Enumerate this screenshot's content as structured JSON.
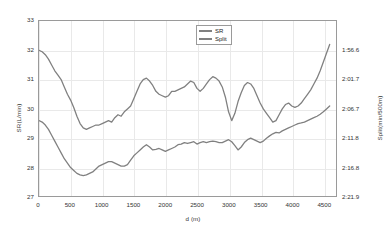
{
  "chart_data": {
    "type": "line",
    "title": "",
    "xlabel": "d (m)",
    "ylabel": "SR(L/min)",
    "ylabel_right": "Split(min/500m)",
    "xlim": [
      0,
      4700
    ],
    "ylim": [
      27,
      33
    ],
    "grid": true,
    "legend_position": "top-center",
    "xticks": [
      0,
      500,
      1000,
      1500,
      2000,
      2500,
      3000,
      3500,
      4000,
      4500
    ],
    "xticklabels": [
      "0",
      "500",
      "1000",
      "1500",
      "2000",
      "2500",
      "3000",
      "3500",
      "4000",
      "4500"
    ],
    "yticks": [
      27,
      28,
      29,
      30,
      31,
      32,
      33
    ],
    "yticklabels": [
      "27",
      "28",
      "29",
      "30",
      "31",
      "32",
      "33"
    ],
    "yticks_right": [
      27,
      28,
      29,
      30,
      31,
      32
    ],
    "yticklabels_right": [
      "2:21.9",
      "2:16.8",
      "2:11.8",
      "2:06.7",
      "2:01.7",
      "1:56.6"
    ],
    "line_color": "#808080",
    "series": [
      {
        "name": "SR",
        "x": [
          0,
          50,
          100,
          150,
          200,
          250,
          300,
          350,
          400,
          450,
          500,
          550,
          600,
          650,
          700,
          750,
          800,
          850,
          900,
          950,
          1000,
          1050,
          1100,
          1150,
          1200,
          1250,
          1300,
          1350,
          1400,
          1450,
          1500,
          1550,
          1600,
          1650,
          1700,
          1750,
          1800,
          1850,
          1900,
          1950,
          2000,
          2050,
          2100,
          2150,
          2200,
          2250,
          2300,
          2350,
          2400,
          2450,
          2500,
          2550,
          2600,
          2650,
          2700,
          2750,
          2800,
          2850,
          2900,
          2950,
          3000,
          3050,
          3100,
          3150,
          3200,
          3250,
          3300,
          3350,
          3400,
          3450,
          3500,
          3550,
          3600,
          3650,
          3700,
          3750,
          3800,
          3850,
          3900,
          3950,
          4000,
          4050,
          4100,
          4150,
          4200,
          4250,
          4300,
          4350,
          4400,
          4450,
          4500,
          4550,
          4600
        ],
        "values": [
          32.0,
          31.95,
          31.85,
          31.7,
          31.5,
          31.3,
          31.15,
          31.0,
          30.75,
          30.5,
          30.3,
          30.05,
          29.75,
          29.5,
          29.35,
          29.3,
          29.35,
          29.4,
          29.45,
          29.45,
          29.5,
          29.55,
          29.6,
          29.55,
          29.7,
          29.8,
          29.75,
          29.9,
          30.0,
          30.1,
          30.35,
          30.6,
          30.85,
          31.0,
          31.05,
          30.95,
          30.8,
          30.6,
          30.5,
          30.45,
          30.4,
          30.45,
          30.6,
          30.6,
          30.65,
          30.7,
          30.75,
          30.85,
          30.95,
          30.9,
          30.7,
          30.6,
          30.7,
          30.85,
          31.0,
          31.1,
          31.05,
          30.95,
          30.75,
          30.4,
          29.9,
          29.6,
          29.85,
          30.25,
          30.55,
          30.8,
          30.9,
          30.85,
          30.7,
          30.45,
          30.2,
          30.0,
          29.85,
          29.7,
          29.55,
          29.6,
          29.8,
          30.0,
          30.15,
          30.2,
          30.1,
          30.05,
          30.1,
          30.2,
          30.35,
          30.5,
          30.65,
          30.85,
          31.05,
          31.3,
          31.6,
          31.9,
          32.2
        ]
      },
      {
        "name": "Split",
        "x": [
          0,
          50,
          100,
          150,
          200,
          250,
          300,
          350,
          400,
          450,
          500,
          550,
          600,
          650,
          700,
          750,
          800,
          850,
          900,
          950,
          1000,
          1050,
          1100,
          1150,
          1200,
          1250,
          1300,
          1350,
          1400,
          1450,
          1500,
          1550,
          1600,
          1650,
          1700,
          1750,
          1800,
          1850,
          1900,
          1950,
          2000,
          2050,
          2100,
          2150,
          2200,
          2250,
          2300,
          2350,
          2400,
          2450,
          2500,
          2550,
          2600,
          2650,
          2700,
          2750,
          2800,
          2850,
          2900,
          2950,
          3000,
          3050,
          3100,
          3150,
          3200,
          3250,
          3300,
          3350,
          3400,
          3450,
          3500,
          3550,
          3600,
          3650,
          3700,
          3750,
          3800,
          3850,
          3900,
          3950,
          4000,
          4050,
          4100,
          4150,
          4200,
          4250,
          4300,
          4350,
          4400,
          4450,
          4500,
          4550,
          4600
        ],
        "values": [
          29.6,
          29.55,
          29.45,
          29.3,
          29.1,
          28.9,
          28.7,
          28.5,
          28.3,
          28.15,
          28.0,
          27.9,
          27.8,
          27.75,
          27.72,
          27.75,
          27.8,
          27.85,
          27.95,
          28.05,
          28.1,
          28.15,
          28.2,
          28.2,
          28.15,
          28.1,
          28.05,
          28.05,
          28.1,
          28.25,
          28.4,
          28.5,
          28.6,
          28.7,
          28.78,
          28.7,
          28.6,
          28.62,
          28.65,
          28.6,
          28.55,
          28.6,
          28.65,
          28.7,
          28.78,
          28.8,
          28.85,
          28.82,
          28.85,
          28.88,
          28.8,
          28.85,
          28.88,
          28.85,
          28.88,
          28.9,
          28.88,
          28.85,
          28.85,
          28.9,
          28.95,
          28.88,
          28.75,
          28.6,
          28.7,
          28.85,
          28.95,
          29.0,
          28.95,
          28.9,
          28.85,
          28.9,
          29.0,
          29.08,
          29.15,
          29.2,
          29.18,
          29.25,
          29.3,
          29.35,
          29.4,
          29.45,
          29.5,
          29.52,
          29.55,
          29.6,
          29.65,
          29.7,
          29.75,
          29.82,
          29.9,
          30.0,
          30.1
        ]
      }
    ]
  },
  "legend": {
    "items": [
      {
        "label": "SR"
      },
      {
        "label": "Split"
      }
    ]
  }
}
